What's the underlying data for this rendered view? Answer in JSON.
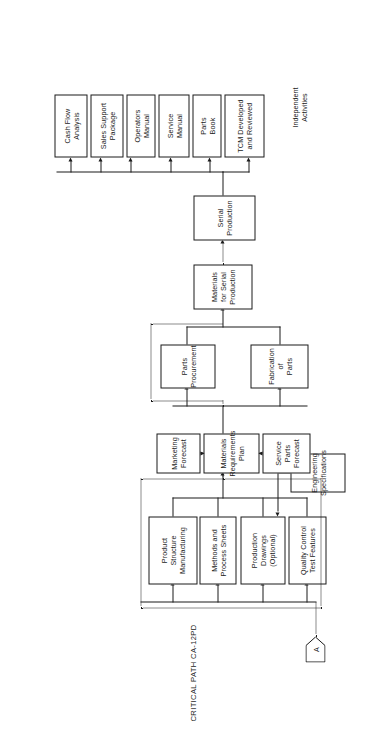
{
  "diagram": {
    "title": "CRITICAL PATH CA-12PD",
    "type": "flowchart",
    "orientation": "rotated-90-ccw",
    "group_label_independent": "Independent\nActivities",
    "offpage_connector_label": "A",
    "nodes": {
      "serial_production": "Serial\nProduction",
      "materials_serial": "Materials\nfor Serial\nProduction",
      "parts_procurement": "Parts\nProcurement",
      "fabrication_of_parts": "Fabrication\nof\nParts",
      "marketing_forecast": "Marketing\nForecast",
      "materials_requirements_plan": "Materials\nRequirements\nPlan",
      "service_parts_forecast": "Service\nParts\nForecast",
      "product_structure_manufacturing": "Product\nStructure\nManufacturing",
      "methods_process_sheets": "Methods and\nProcess Sheets",
      "production_drawings": "Production\nDrawings\n(Optional)",
      "quality_control_test": "Quality Control\nTest Features",
      "engineering_specifications": "Engineering\nSpecifications"
    },
    "independent_activities": [
      "Cash Flow\nAnalysis",
      "Sales Support\nPackage",
      "Operators\nManual",
      "Service\nManual",
      "Parts\nBook",
      "TCM Developed\nand Reviewed"
    ],
    "colors": {
      "ink": "#1a1a1a",
      "paper": "#ffffff"
    }
  }
}
